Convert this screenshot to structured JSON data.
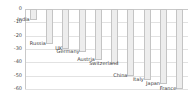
{
  "chart_data": {
    "type": "bar",
    "title": "",
    "xlabel": "",
    "ylabel": "",
    "ylim": [
      -60,
      0
    ],
    "grid": true,
    "legend": "none",
    "orientation": "vertical-negative",
    "yticks": [
      "0",
      "-10",
      "-20",
      "-30",
      "-40",
      "-50",
      "-60"
    ],
    "ytick_values": [
      0,
      -10,
      -20,
      -30,
      -40,
      -50,
      -60
    ],
    "categories": [
      "India",
      "Russia",
      "UK",
      "Germany",
      "Austria",
      "Switzerland",
      "China",
      "Italy",
      "Japan",
      "France"
    ],
    "values": [
      -8,
      -26,
      -30,
      -32,
      -38,
      -41,
      -50,
      -53,
      -56,
      -60
    ],
    "bars": [
      {
        "label": "India",
        "value": -8
      },
      {
        "label": "Russia",
        "value": -26
      },
      {
        "label": "UK",
        "value": -30
      },
      {
        "label": "Germany",
        "value": -32
      },
      {
        "label": "Austria",
        "value": -38
      },
      {
        "label": "Switzerland",
        "value": -41
      },
      {
        "label": "China",
        "value": -50
      },
      {
        "label": "Italy",
        "value": -53
      },
      {
        "label": "Japan",
        "value": -56
      },
      {
        "label": "France",
        "value": -60
      }
    ],
    "colors": {
      "bar_fill": "#ededed",
      "bar_border": "#c4c4c4",
      "grid": "#e2e2e2",
      "axis": "#c9c9c9",
      "text": "#3c3c3c",
      "background": "#ffffff"
    }
  }
}
